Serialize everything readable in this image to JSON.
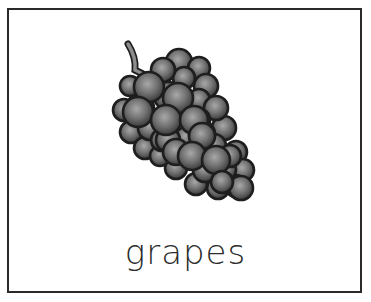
{
  "card": {
    "word": "grapes",
    "image": {
      "icon": "grapes-icon",
      "description": "bunch of grapes illustration with stem"
    }
  },
  "colors": {
    "border": "#2a2a2a",
    "grape_light": "#9a9a9a",
    "grape_dark": "#3c3c3c",
    "outline": "#1e1e1e",
    "stem": "#8c8c8c",
    "text": "#2b2b2b"
  }
}
